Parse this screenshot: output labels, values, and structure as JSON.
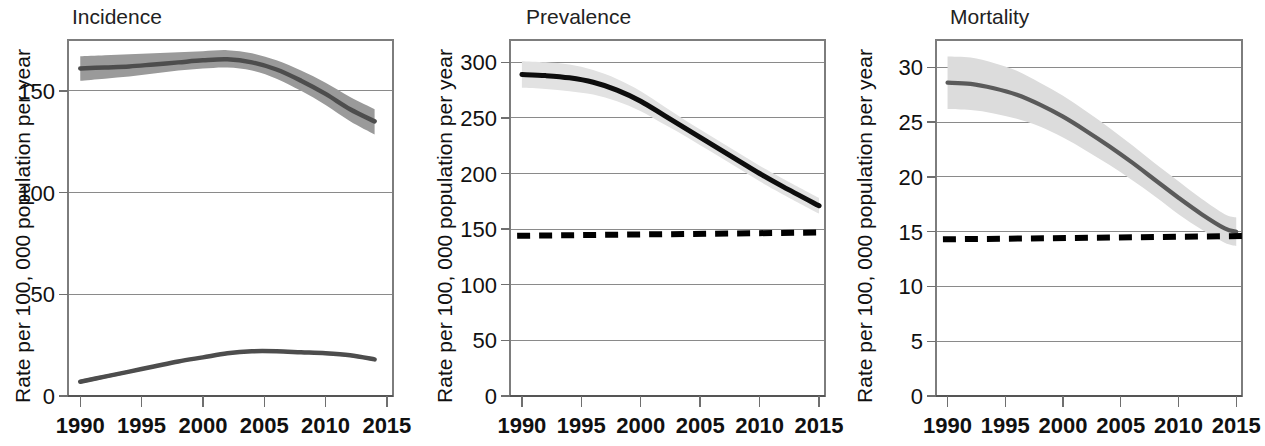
{
  "figure": {
    "title": "",
    "panel_count": 3,
    "shared_ylabel": "Rate per 100, 000 population per year",
    "shared_xticks": [
      "1990",
      "1995",
      "2000",
      "2005",
      "2010",
      "2015"
    ],
    "colors": {
      "incidence_band": "#9a9a9a",
      "incidence_line": "#4d4d4d",
      "prevalence_band": "#e2e2e2",
      "prevalence_line": "#0d0d0d",
      "mortality_band": "#dcdcdc",
      "mortality_line": "#5a5a5a",
      "reference_line": "#000000",
      "grid": "#8a8a8a",
      "frame": "#7d7d7d",
      "text": "#111111",
      "background": "#ffffff"
    }
  },
  "chart_data": [
    {
      "type": "line",
      "title": "Incidence",
      "panel_index": 0,
      "xlabel": "",
      "ylabel": "Rate per 100, 000 population per year",
      "xlim": [
        1989,
        2015.5
      ],
      "ylim": [
        0,
        175
      ],
      "xticks": [
        1990,
        1995,
        2000,
        2005,
        2010,
        2015
      ],
      "xticklabels": [
        "1990",
        "1995",
        "2000",
        "2005",
        "2010",
        "2015"
      ],
      "yticks": [
        0,
        50,
        100,
        150
      ],
      "yticklabels": [
        "0",
        "50",
        "100",
        "150"
      ],
      "grid": true,
      "grid_axis": "y",
      "legend": false,
      "reference_line": null,
      "series": [
        {
          "name": "upper-incidence",
          "style": "solid",
          "color": "#4d4d4d",
          "band_color": "#9a9a9a",
          "x": [
            1990,
            1992,
            1994,
            1996,
            1998,
            2000,
            2002,
            2004,
            2006,
            2008,
            2010,
            2012,
            2014
          ],
          "values": [
            161,
            161.5,
            162,
            163,
            164,
            165,
            165.5,
            164,
            160.5,
            155,
            148.5,
            141,
            135
          ],
          "ci_lower": [
            155,
            156,
            157,
            158.5,
            160,
            161,
            161.5,
            160,
            156,
            150,
            143,
            135,
            128.5
          ],
          "ci_upper": [
            167,
            167.5,
            168,
            168.5,
            169,
            169.5,
            170,
            168.5,
            165,
            160,
            154,
            147,
            141
          ]
        },
        {
          "name": "lower-incidence",
          "style": "solid",
          "color": "#4d4d4d",
          "band_color": "#9a9a9a",
          "x": [
            1990,
            1992,
            1994,
            1996,
            1998,
            2000,
            2002,
            2004,
            2006,
            2008,
            2010,
            2012,
            2014
          ],
          "values": [
            7,
            9.5,
            12,
            14.5,
            17,
            19,
            21,
            22,
            22,
            21.5,
            21,
            20,
            18
          ],
          "ci_lower": [
            6,
            8.6,
            11.2,
            13.8,
            16.3,
            18.3,
            20.3,
            21.3,
            21.3,
            20.8,
            20.2,
            19.2,
            17.2
          ],
          "ci_upper": [
            8,
            10.4,
            12.8,
            15.2,
            17.7,
            19.7,
            21.7,
            22.7,
            22.7,
            22.2,
            21.8,
            20.8,
            18.8
          ]
        }
      ]
    },
    {
      "type": "line",
      "title": "Prevalence",
      "panel_index": 1,
      "xlabel": "",
      "ylabel": "Rate per 100, 000 population per year",
      "xlim": [
        1989,
        2015.5
      ],
      "ylim": [
        0,
        320
      ],
      "xticks": [
        1990,
        1995,
        2000,
        2005,
        2010,
        2015
      ],
      "xticklabels": [
        "1990",
        "1995",
        "2000",
        "2005",
        "2010",
        "2015"
      ],
      "yticks": [
        0,
        50,
        100,
        150,
        200,
        250,
        300
      ],
      "yticklabels": [
        "0",
        "50",
        "100",
        "150",
        "200",
        "250",
        "300"
      ],
      "grid": true,
      "grid_axis": "y",
      "legend": false,
      "reference_line": {
        "name": "target-threshold",
        "style": "dashed",
        "color": "#000000",
        "value_start": 144,
        "value_end": 147
      },
      "series": [
        {
          "name": "prevalence",
          "style": "solid",
          "color": "#0d0d0d",
          "band_color": "#e2e2e2",
          "x": [
            1990,
            1992,
            1994,
            1996,
            1998,
            2000,
            2002,
            2004,
            2006,
            2008,
            2010,
            2012,
            2015
          ],
          "values": [
            289,
            288,
            286,
            282,
            275,
            265,
            252,
            239,
            226,
            213,
            200,
            188,
            171
          ],
          "ci_lower": [
            277,
            276,
            274,
            271,
            265,
            256,
            244,
            232,
            219,
            206,
            193,
            181,
            164
          ],
          "ci_upper": [
            301,
            300,
            298,
            293,
            285,
            274,
            260,
            246,
            233,
            220,
            207,
            195,
            178
          ]
        }
      ]
    },
    {
      "type": "line",
      "title": "Mortality",
      "panel_index": 2,
      "xlabel": "",
      "ylabel": "Rate per 100, 000 population per year",
      "xlim": [
        1989,
        2015.5
      ],
      "ylim": [
        0,
        32.5
      ],
      "xticks": [
        1990,
        1995,
        2000,
        2005,
        2010,
        2015
      ],
      "xticklabels": [
        "1990",
        "1995",
        "2000",
        "2005",
        "2010",
        "2015"
      ],
      "yticks": [
        0,
        5,
        10,
        15,
        20,
        25,
        30
      ],
      "yticklabels": [
        "0",
        "5",
        "10",
        "15",
        "20",
        "25",
        "30"
      ],
      "grid": true,
      "grid_axis": "y",
      "legend": false,
      "reference_line": {
        "name": "target-threshold",
        "style": "dashed",
        "color": "#000000",
        "value_start": 14.3,
        "value_end": 14.6
      },
      "series": [
        {
          "name": "mortality",
          "style": "solid",
          "color": "#5a5a5a",
          "band_color": "#dcdcdc",
          "x": [
            1990,
            1992,
            1994,
            1996,
            1998,
            2000,
            2002,
            2004,
            2006,
            2008,
            2010,
            2012,
            2014,
            2015
          ],
          "values": [
            28.6,
            28.5,
            28.1,
            27.5,
            26.6,
            25.5,
            24.2,
            22.8,
            21.3,
            19.7,
            18.1,
            16.6,
            15.3,
            15.0
          ],
          "ci_lower": [
            26.2,
            26.1,
            25.8,
            25.3,
            24.6,
            23.6,
            22.4,
            21.1,
            19.7,
            18.2,
            16.6,
            15.2,
            14.0,
            13.7
          ],
          "ci_upper": [
            31.0,
            30.9,
            30.4,
            29.7,
            28.6,
            27.4,
            26.0,
            24.5,
            22.9,
            21.2,
            19.6,
            18.0,
            16.6,
            16.3
          ]
        }
      ]
    }
  ]
}
